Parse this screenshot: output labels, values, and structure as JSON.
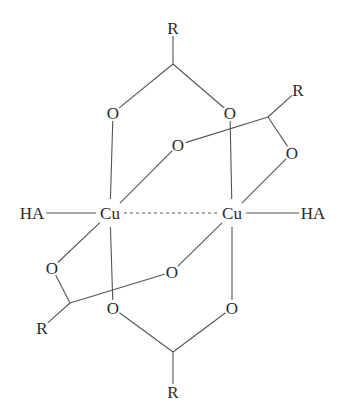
{
  "diagram": {
    "type": "chemical-structure",
    "atoms": [
      {
        "id": "R_top",
        "label": "R",
        "x": 173,
        "y": 28
      },
      {
        "id": "C_top",
        "label": "",
        "x": 173,
        "y": 64
      },
      {
        "id": "O1",
        "label": "O",
        "x": 113,
        "y": 113
      },
      {
        "id": "O2",
        "label": "O",
        "x": 230,
        "y": 113
      },
      {
        "id": "R_ur",
        "label": "R",
        "x": 298,
        "y": 90
      },
      {
        "id": "C_r",
        "label": "",
        "x": 268,
        "y": 117
      },
      {
        "id": "O3",
        "label": "O",
        "x": 178,
        "y": 145
      },
      {
        "id": "O4",
        "label": "O",
        "x": 292,
        "y": 153
      },
      {
        "id": "HA_l",
        "label": "HA",
        "x": 32,
        "y": 213
      },
      {
        "id": "Cu1",
        "label": "Cu",
        "x": 110,
        "y": 213
      },
      {
        "id": "Cu2",
        "label": "Cu",
        "x": 232,
        "y": 213
      },
      {
        "id": "HA_r",
        "label": "HA",
        "x": 313,
        "y": 213
      },
      {
        "id": "O5",
        "label": "O",
        "x": 52,
        "y": 268
      },
      {
        "id": "O6",
        "label": "O",
        "x": 172,
        "y": 272
      },
      {
        "id": "C_l",
        "label": "",
        "x": 70,
        "y": 303
      },
      {
        "id": "R_ll",
        "label": "R",
        "x": 42,
        "y": 328
      },
      {
        "id": "O7",
        "label": "O",
        "x": 113,
        "y": 308
      },
      {
        "id": "O8",
        "label": "O",
        "x": 232,
        "y": 308
      },
      {
        "id": "C_bot",
        "label": "",
        "x": 173,
        "y": 352
      },
      {
        "id": "R_bot",
        "label": "R",
        "x": 173,
        "y": 392
      }
    ],
    "bonds": [
      {
        "from": "R_top",
        "to": "C_top",
        "style": "solid"
      },
      {
        "from": "C_top",
        "to": "O1",
        "style": "solid"
      },
      {
        "from": "C_top",
        "to": "O2",
        "style": "solid"
      },
      {
        "from": "O1",
        "to": "Cu1",
        "style": "solid"
      },
      {
        "from": "O2",
        "to": "Cu2",
        "style": "solid"
      },
      {
        "from": "R_ur",
        "to": "C_r",
        "style": "solid"
      },
      {
        "from": "C_r",
        "to": "O3",
        "style": "solid"
      },
      {
        "from": "C_r",
        "to": "O4",
        "style": "solid"
      },
      {
        "from": "O3",
        "to": "Cu1",
        "style": "solid"
      },
      {
        "from": "O4",
        "to": "Cu2",
        "style": "solid"
      },
      {
        "from": "HA_l",
        "to": "Cu1",
        "style": "solid"
      },
      {
        "from": "Cu1",
        "to": "Cu2",
        "style": "dashed"
      },
      {
        "from": "Cu2",
        "to": "HA_r",
        "style": "solid"
      },
      {
        "from": "Cu1",
        "to": "O5",
        "style": "solid"
      },
      {
        "from": "O5",
        "to": "C_l",
        "style": "solid"
      },
      {
        "from": "C_l",
        "to": "R_ll",
        "style": "solid"
      },
      {
        "from": "C_l",
        "to": "O6",
        "style": "solid"
      },
      {
        "from": "O6",
        "to": "Cu2",
        "style": "solid"
      },
      {
        "from": "Cu1",
        "to": "O7",
        "style": "solid"
      },
      {
        "from": "Cu2",
        "to": "O8",
        "style": "solid"
      },
      {
        "from": "O7",
        "to": "C_bot",
        "style": "solid"
      },
      {
        "from": "O8",
        "to": "C_bot",
        "style": "solid"
      },
      {
        "from": "C_bot",
        "to": "R_bot",
        "style": "solid"
      }
    ]
  }
}
